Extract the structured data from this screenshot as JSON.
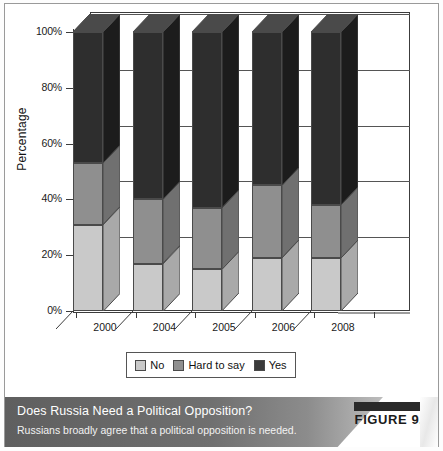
{
  "figure": {
    "caption_title": "Does Russia Need a Political Opposition?",
    "caption_subtitle": "Russians broadly agree that a political opposition is needed.",
    "figure_label": "FIGURE 9.5"
  },
  "colors": {
    "no": "#c9c9c9",
    "hard_to_say": "#8f8f8f",
    "yes": "#2e2e2e",
    "no_side": "#a9a9a9",
    "hard_to_say_side": "#707070",
    "yes_side": "#1c1c1c",
    "outline": "#4a4a4a",
    "axis": "#3c3c3c"
  },
  "legend": {
    "items": [
      {
        "label": "No",
        "key": "no"
      },
      {
        "label": "Hard to say",
        "key": "hard_to_say"
      },
      {
        "label": "Yes",
        "key": "yes"
      }
    ]
  },
  "chart_data": {
    "type": "bar",
    "subtype": "stacked-100-percent-3d",
    "title": "Does Russia Need a Political Opposition?",
    "xlabel": "",
    "ylabel": "Percentage",
    "categories": [
      "2000",
      "2004",
      "2005",
      "2006",
      "2008"
    ],
    "ytick_labels": [
      "0%",
      "20%",
      "40%",
      "60%",
      "80%",
      "100%"
    ],
    "ytick_values": [
      0,
      20,
      40,
      60,
      80,
      100
    ],
    "ylim": [
      0,
      100
    ],
    "grid": true,
    "legend_position": "bottom",
    "series": [
      {
        "name": "No",
        "values": [
          31,
          17,
          15,
          19,
          19
        ]
      },
      {
        "name": "Hard to say",
        "values": [
          22,
          23,
          22,
          26,
          19
        ]
      },
      {
        "name": "Yes",
        "values": [
          47,
          60,
          63,
          55,
          62
        ]
      }
    ],
    "stack_order_bottom_to_top": [
      "No",
      "Hard to say",
      "Yes"
    ],
    "cumulative_boundaries": {
      "2000": [
        31,
        53
      ],
      "2004": [
        17,
        40
      ],
      "2005": [
        15,
        37
      ],
      "2006": [
        19,
        45
      ],
      "2008": [
        19,
        38
      ]
    }
  }
}
